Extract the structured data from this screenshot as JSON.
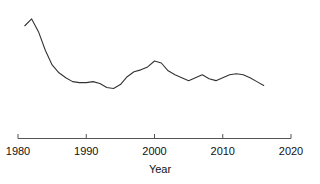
{
  "chart_data": {
    "type": "line",
    "title": "",
    "subtitle": "",
    "xlabel": "Year",
    "ylabel": "",
    "xlim": [
      1980,
      2020
    ],
    "ylim": [
      0,
      100
    ],
    "grid": false,
    "legend": null,
    "xticks": [
      1980,
      1990,
      2000,
      2010,
      2020
    ],
    "xticklabels": [
      "1980",
      "1990",
      "2000",
      "2010",
      "2020"
    ],
    "yticks": [],
    "yticklabels": [],
    "line_color": "#333333",
    "axis_color": "#555555",
    "series": [
      {
        "name": "series-1",
        "x": [
          1981,
          1982,
          1983,
          1984,
          1985,
          1986,
          1987,
          1988,
          1989,
          1990,
          1991,
          1992,
          1993,
          1994,
          1995,
          1996,
          1997,
          1998,
          1999,
          2000,
          2001,
          2002,
          2003,
          2004,
          2005,
          2006,
          2007,
          2008,
          2009,
          2010,
          2011,
          2012,
          2013,
          2014,
          2015,
          2016
        ],
        "y": [
          88,
          95,
          82,
          63,
          48,
          40,
          35,
          31,
          30,
          30,
          31,
          29,
          25,
          24,
          28,
          36,
          41,
          43,
          46,
          52,
          50,
          42,
          38,
          35,
          32,
          35,
          38,
          34,
          32,
          35,
          38,
          39,
          38,
          35,
          31,
          27
        ]
      }
    ]
  },
  "axis": {
    "title": "Year",
    "tick_labels": [
      "1980",
      "1990",
      "2000",
      "2010",
      "2020"
    ]
  }
}
